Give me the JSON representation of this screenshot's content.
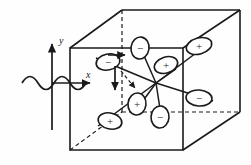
{
  "figure": {
    "title": "",
    "type": "scientific-diagram",
    "background_color": "#fefefe",
    "ink_color": "#1a1a1a"
  },
  "axes": {
    "y_label": "y",
    "x_label": "x",
    "y_axis": {
      "x": 52,
      "y_top": 43,
      "y_bottom": 130
    },
    "x_axis": {
      "y": 83,
      "x_left": 52,
      "x_right": 92
    }
  },
  "wave": {
    "name": "incident-wave",
    "baseline_y": 83,
    "x_start": 22,
    "x_end": 86,
    "amplitude": 11,
    "cycles": 2
  },
  "cube": {
    "name": "unit-cell-cube",
    "front": {
      "tl": [
        70,
        48
      ],
      "tr": [
        183,
        48
      ],
      "br": [
        183,
        150
      ],
      "bl": [
        70,
        150
      ]
    },
    "back": {
      "tl": [
        122,
        10
      ],
      "tr": [
        240,
        10
      ],
      "br": [
        240,
        112
      ],
      "bl": [
        122,
        112
      ]
    },
    "hidden_edges": [
      "back-left-vertical",
      "back-bottom"
    ]
  },
  "center": {
    "x": 156,
    "y": 83
  },
  "lobes": [
    {
      "id": "lobe-1",
      "sign": "−",
      "cx": 108,
      "cy": 62,
      "rx": 12,
      "ry": 8,
      "rot": -12
    },
    {
      "id": "lobe-2",
      "sign": "−",
      "cx": 140,
      "cy": 48,
      "rx": 9,
      "ry": 11,
      "rot": 8
    },
    {
      "id": "lobe-3",
      "sign": "+",
      "cx": 166,
      "cy": 65,
      "rx": 12,
      "ry": 8,
      "rot": -18
    },
    {
      "id": "lobe-4",
      "sign": "+",
      "cx": 199,
      "cy": 46,
      "rx": 13,
      "ry": 8,
      "rot": -16
    },
    {
      "id": "lobe-5",
      "sign": "−",
      "cx": 199,
      "cy": 98,
      "rx": 13,
      "ry": 8,
      "rot": 4
    },
    {
      "id": "lobe-6",
      "sign": "−",
      "cx": 160,
      "cy": 117,
      "rx": 9,
      "ry": 11,
      "rot": 4
    },
    {
      "id": "lobe-7",
      "sign": "+",
      "cx": 137,
      "cy": 104,
      "rx": 9,
      "ry": 11,
      "rot": 6
    },
    {
      "id": "lobe-8",
      "sign": "+",
      "cx": 110,
      "cy": 121,
      "rx": 12,
      "ry": 8,
      "rot": 12
    }
  ],
  "arrows": [
    {
      "id": "arrow-down-solid",
      "style": "solid",
      "x1": 115,
      "y1": 66,
      "x2": 115,
      "y2": 92
    },
    {
      "id": "arrow-diagonal-dashed",
      "style": "dashed",
      "x1": 122,
      "y1": 72,
      "x2": 136,
      "y2": 90
    },
    {
      "id": "arrow-inner-right",
      "style": "solid",
      "x1": 110,
      "y1": 55,
      "x2": 126,
      "y2": 55
    }
  ],
  "signs": {
    "plus": "+",
    "minus": "−"
  }
}
